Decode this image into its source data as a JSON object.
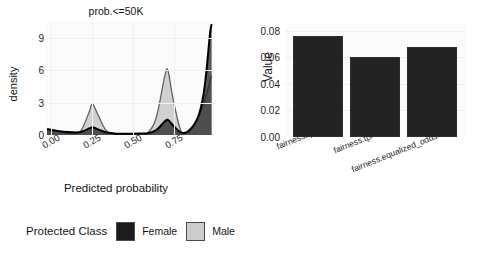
{
  "figure": {
    "background": "#ffffff",
    "panel_background": "#fbfbfb",
    "gridline_color": "#f0f0f0"
  },
  "legend": {
    "title": "Protected Class",
    "items": [
      {
        "label": "Female",
        "color": "#1c1c1c"
      },
      {
        "label": "Male",
        "color": "#cccccc"
      }
    ]
  },
  "chart_data": [
    {
      "id": "density-plot",
      "type": "area",
      "title": "prob.<=50K",
      "xlabel": "Predicted probability",
      "ylabel": "density",
      "xlim": [
        0.0,
        1.0
      ],
      "ylim": [
        0,
        10.5
      ],
      "xticks": [
        "0.00",
        "0.25",
        "0.50",
        "0.75"
      ],
      "xtick_values": [
        0.0,
        0.25,
        0.5,
        0.75
      ],
      "yticks": [
        "0",
        "3",
        "6",
        "9"
      ],
      "ytick_values": [
        0,
        3,
        6,
        9
      ],
      "grid": true,
      "legend_position": "bottom",
      "series": [
        {
          "name": "Female",
          "color": "#1c1c1c",
          "description": "Dark filled density; low broad tail from 0.0, small bump near 0.27, moderate bump near 0.72, very sharp tall spike rising to ~10.3 at x~0.97",
          "x": [
            0.0,
            0.05,
            0.1,
            0.15,
            0.2,
            0.25,
            0.27,
            0.3,
            0.35,
            0.4,
            0.45,
            0.5,
            0.55,
            0.6,
            0.65,
            0.7,
            0.72,
            0.75,
            0.8,
            0.85,
            0.9,
            0.93,
            0.95,
            0.97,
            0.98
          ],
          "values": [
            0.55,
            0.42,
            0.3,
            0.25,
            0.28,
            0.6,
            0.72,
            0.55,
            0.25,
            0.15,
            0.12,
            0.12,
            0.13,
            0.16,
            0.45,
            1.25,
            1.4,
            0.9,
            0.22,
            0.45,
            1.7,
            3.6,
            6.1,
            9.4,
            10.3
          ]
        },
        {
          "name": "Male",
          "color": "#cccccc",
          "description": "Light grey filled density; peak ~2.9 near x=0.27, peak ~6.0 near x=0.72, rising tail to ~5.5 at right edge",
          "x": [
            0.0,
            0.05,
            0.1,
            0.15,
            0.2,
            0.25,
            0.27,
            0.3,
            0.35,
            0.4,
            0.45,
            0.5,
            0.55,
            0.6,
            0.65,
            0.7,
            0.72,
            0.75,
            0.8,
            0.85,
            0.9,
            0.93,
            0.95,
            0.97,
            0.98
          ],
          "values": [
            0.45,
            0.35,
            0.22,
            0.18,
            0.35,
            2.1,
            2.9,
            2.0,
            0.45,
            0.12,
            0.08,
            0.08,
            0.1,
            0.2,
            1.6,
            5.4,
            6.0,
            3.4,
            0.3,
            0.55,
            1.6,
            2.8,
            3.8,
            5.0,
            5.5
          ]
        }
      ]
    },
    {
      "id": "bar-chart",
      "type": "bar",
      "title": "",
      "xlabel": "Metrics",
      "ylabel": "Value",
      "categories": [
        "fairness.fpr",
        "fairness.tpr",
        "fairness.equalized_odds"
      ],
      "values": [
        0.076,
        0.06,
        0.068
      ],
      "bar_color": "#232323",
      "ylim": [
        0.0,
        0.085
      ],
      "yticks": [
        "0.00",
        "0.02",
        "0.04",
        "0.06",
        "0.08"
      ],
      "ytick_values": [
        0.0,
        0.02,
        0.04,
        0.06,
        0.08
      ],
      "grid": true,
      "legend_position": "none"
    }
  ]
}
